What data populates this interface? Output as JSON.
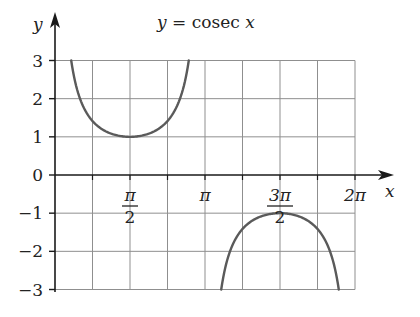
{
  "chart_data": {
    "type": "line",
    "title": "y = cosec x",
    "title_parts": {
      "lhs": "y",
      "eq": " = cosec ",
      "var": "x"
    },
    "xlabel": "x",
    "ylabel": "y",
    "xlim": [
      0,
      6.2832
    ],
    "ylim": [
      -3,
      3
    ],
    "grid": true,
    "x_grid_step": "π/4",
    "y_grid_step": 1,
    "x_ticks": [
      {
        "value": 1.5708,
        "label_num": "π",
        "label_den": "2",
        "fraction": true
      },
      {
        "value": 3.1416,
        "label": "π",
        "fraction": false
      },
      {
        "value": 4.7124,
        "label_num": "3π",
        "label_den": "2",
        "fraction": true
      },
      {
        "value": 6.2832,
        "label": "2π",
        "fraction": false
      }
    ],
    "y_ticks": [
      {
        "value": 3,
        "label": "3"
      },
      {
        "value": 2,
        "label": "2"
      },
      {
        "value": 1,
        "label": "1"
      },
      {
        "value": 0,
        "label": "0"
      },
      {
        "value": -1,
        "label": "-1"
      },
      {
        "value": -2,
        "label": "-2"
      },
      {
        "value": -3,
        "label": "-3"
      }
    ],
    "series": [
      {
        "name": "cosec x (0 < x < π)",
        "x": [
          0.3398,
          0.4,
          0.5,
          0.6,
          0.7,
          0.8,
          1.0,
          1.2,
          1.4,
          1.5708,
          1.7,
          1.9,
          2.1,
          2.3,
          2.4,
          2.5,
          2.6,
          2.7,
          2.8018
        ],
        "y": [
          3.0,
          2.568,
          2.086,
          1.771,
          1.552,
          1.394,
          1.188,
          1.073,
          1.015,
          1.0,
          1.008,
          1.057,
          1.158,
          1.341,
          1.48,
          1.671,
          1.94,
          2.34,
          3.0
        ]
      },
      {
        "name": "cosec x (π < x < 2π)",
        "x": [
          3.4814,
          3.6,
          3.8,
          4.0,
          4.2,
          4.4,
          4.5,
          4.7124,
          4.9,
          5.1,
          5.3,
          5.5,
          5.7,
          5.9434
        ],
        "y": [
          -3.0,
          -2.264,
          -1.632,
          -1.321,
          -1.149,
          -1.051,
          -1.023,
          -1.0,
          -1.018,
          -1.078,
          -1.201,
          -1.419,
          -1.817,
          -3.0
        ]
      }
    ],
    "key_points": [
      {
        "x": "π/2",
        "y": 1,
        "note": "local minimum"
      },
      {
        "x": "3π/2",
        "y": -1,
        "note": "local maximum"
      }
    ],
    "asymptotes": [
      "x = 0",
      "x = π",
      "x = 2π"
    ]
  }
}
